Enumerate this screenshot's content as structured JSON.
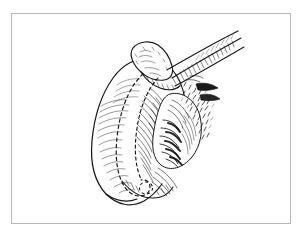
{
  "document": {
    "type": "anatomical-line-illustration",
    "medium": "pen-and-ink engraving / hatched line drawing",
    "title": "",
    "caption": "",
    "page_text": [],
    "has_visible_text": false
  },
  "canvas": {
    "width": 298,
    "height": 232,
    "background_color": "#ffffff"
  },
  "frame": {
    "present": true,
    "x": 11,
    "y": 13,
    "width": 280,
    "height": 211,
    "border_color": "#b9b9b9",
    "border_width": 1,
    "fill_color": "#ffffff"
  },
  "ink": {
    "line_color": "#1a1a1a",
    "hatch_color": "#2b2b2b",
    "dash_color": "#111111",
    "light_hatch_color": "#555555"
  },
  "illustration": {
    "subject_description": "Hatched pen-and-ink drawing of a curved lobed organ mass with two dashed resection lines across its body, a knobbed bone-like process at the top, two tapering tubular vessels running to the upper right, and a fringed lobulated structure with stippling on the right side.",
    "orientation": "organ body curves from upper-right down to lower-left",
    "parts": [
      {
        "id": "organ-body",
        "name": "main-lobed-organ-body",
        "description": "Large crescent-shaped hatched mass forming the left and lower bulk of the figure",
        "shading": "fine parallel hatching following the contour"
      },
      {
        "id": "knob-process",
        "name": "knobbed-bony-process",
        "description": "Rounded knob-like head at the top of the mass with short stipple marks",
        "shading": "light outline with sparse stippling"
      },
      {
        "id": "vessel-upper",
        "name": "upper-tubular-vessel",
        "description": "Upper tapering tube running from the knob toward the upper-right corner",
        "shading": "outline with cross-hatched shadow on the lower edge"
      },
      {
        "id": "vessel-lower",
        "name": "lower-tubular-vessel",
        "description": "Second tapering tube parallel and below the upper vessel",
        "shading": "outline with dense short hatch marks"
      },
      {
        "id": "dashed-line-outer",
        "name": "outer-dashed-resection-line",
        "description": "Long dashed curve sweeping down the middle of the organ body and hooking at the bottom",
        "style": "dashed"
      },
      {
        "id": "dashed-line-inner",
        "name": "inner-dashed-resection-line",
        "description": "Second dashed curve parallel to and right of the outer dashed line",
        "style": "dashed"
      },
      {
        "id": "fringe-lobules",
        "name": "fringed-lobulated-structure",
        "description": "Cluster of finger-like shaded lobules at the lower right of the organ",
        "shading": "heavy dark hatching between lobules"
      },
      {
        "id": "stipple-field",
        "name": "stippled-fatty-tissue",
        "description": "Loose field of short flicks and dots at the right side suggesting fatty or villous tissue",
        "shading": "stipple and short dashes"
      },
      {
        "id": "spur-tips",
        "name": "right-spur-tips",
        "description": "Two small pointed shaded spurs projecting to the right edge of the figure",
        "shading": "solid dark with small hatch"
      }
    ],
    "dashed_lines_count": 2,
    "tubular_vessels_count": 2
  }
}
